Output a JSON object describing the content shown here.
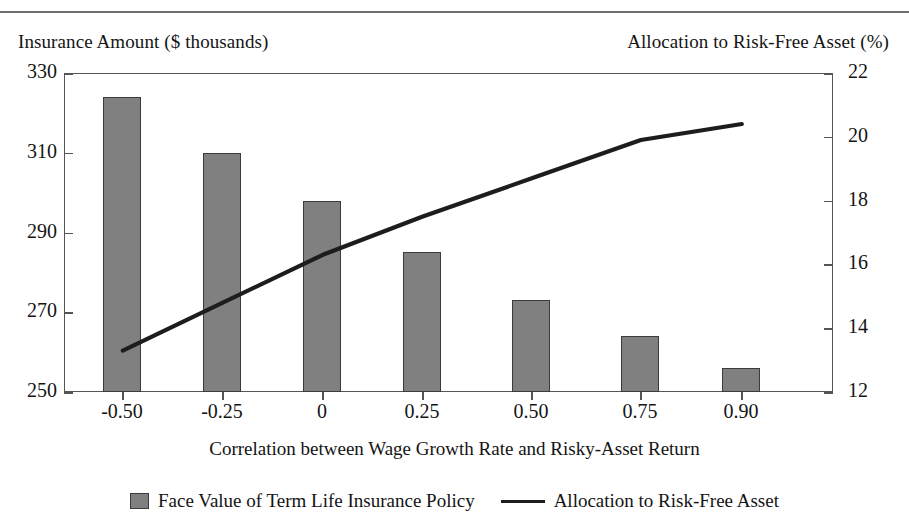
{
  "figure": {
    "left_axis_caption": "Insurance Amount ($ thousands)",
    "right_axis_caption": "Allocation to Risk-Free Asset (%)",
    "colors": {
      "bar_fill": "#808080",
      "bar_edge": "#3b3b3b",
      "line": "#1d1d1d",
      "axis": "#555555",
      "text": "#141414"
    }
  },
  "chart_data": {
    "type": "bar",
    "title": "",
    "xlabel": "Correlation between Wage Growth Rate and Risky-Asset Return",
    "categories": [
      "-0.50",
      "-0.25",
      "0",
      "0.25",
      "0.50",
      "0.75",
      "0.90"
    ],
    "grid": false,
    "legend_position": "bottom",
    "axes": {
      "left": {
        "label": "Insurance Amount ($ thousands)",
        "ylim": [
          250,
          330
        ],
        "ticks": [
          250,
          270,
          290,
          310,
          330
        ],
        "tick_labels": [
          "250",
          "270",
          "290",
          "310",
          "330"
        ]
      },
      "right": {
        "label": "Allocation to Risk-Free Asset (%)",
        "ylim": [
          12,
          22
        ],
        "ticks": [
          12,
          14,
          16,
          18,
          20,
          22
        ],
        "tick_labels": [
          "12",
          "14",
          "16",
          "18",
          "20",
          "22"
        ]
      }
    },
    "series": [
      {
        "name": "Face Value of Term Life Insurance Policy",
        "type": "bar",
        "axis": "left",
        "values": [
          324,
          310,
          298,
          285,
          273,
          264,
          256
        ]
      },
      {
        "name": "Allocation to Risk-Free Asset",
        "type": "line",
        "axis": "right",
        "values": [
          13.3,
          14.8,
          16.3,
          17.5,
          18.7,
          19.9,
          20.4
        ]
      }
    ]
  },
  "legend": {
    "items": [
      {
        "label": "Face Value of Term Life Insurance Policy",
        "marker": "bar-swatch"
      },
      {
        "label": "Allocation to Risk-Free Asset",
        "marker": "line-swatch"
      }
    ]
  }
}
